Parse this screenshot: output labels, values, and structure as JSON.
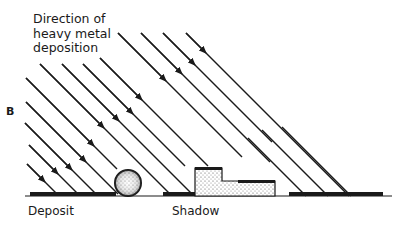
{
  "figure": {
    "panel_letter": "B",
    "caption_lines": [
      "Direction of",
      "heavy metal",
      "deposition"
    ],
    "labels": {
      "deposit": "Deposit",
      "shadow": "Shadow"
    },
    "colors": {
      "ink": "#1a1a1a",
      "background": "#ffffff",
      "stipple": "#555555"
    },
    "elements": {
      "ground_line": "substrate surface",
      "sphere": "spherical particle casting shadow",
      "block": "stepped block object casting shadow",
      "arrows": "parallel diagonal lines indicating direction of heavy metal deposition"
    }
  }
}
